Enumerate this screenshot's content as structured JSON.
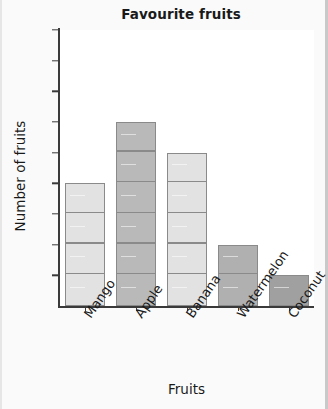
{
  "chart_data": {
    "type": "bar",
    "title": "Favourite fruits",
    "xlabel": "Fruits",
    "ylabel": "Number of fruits",
    "categories": [
      "Mango",
      "Apple",
      "Banana",
      "Watermelon",
      "Coconut"
    ],
    "values": [
      4,
      6,
      5,
      2,
      1
    ],
    "ylim": [
      0,
      9
    ],
    "y_ticks": [
      "0",
      "1",
      "2",
      "3",
      "4",
      "5",
      "6",
      "7",
      "8",
      "9"
    ],
    "grid": false,
    "legend": null,
    "unit_segment_lines": true,
    "bar_colors": [
      "#e2e2e2",
      "#b9b9b9",
      "#e2e2e2",
      "#b0b0b0",
      "#a0a0a0"
    ],
    "bar_edge_color": "#8a8a8a",
    "axis_color": "#3a3a3a",
    "plot_background": "#ffffff",
    "figure_background": "#fafafa"
  }
}
